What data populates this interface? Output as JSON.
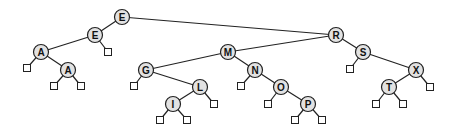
{
  "diagram": {
    "type": "binary-search-tree",
    "nodes": [
      {
        "id": "n1",
        "label": "E",
        "x": 122,
        "y": 17
      },
      {
        "id": "n2",
        "label": "E",
        "x": 95,
        "y": 35
      },
      {
        "id": "n3",
        "label": "A",
        "x": 41,
        "y": 52
      },
      {
        "id": "n4",
        "label": "A",
        "x": 68,
        "y": 70
      },
      {
        "id": "n5",
        "label": "R",
        "x": 336,
        "y": 35
      },
      {
        "id": "n6",
        "label": "M",
        "x": 228,
        "y": 52
      },
      {
        "id": "n7",
        "label": "G",
        "x": 146,
        "y": 70
      },
      {
        "id": "n8",
        "label": "L",
        "x": 200,
        "y": 87
      },
      {
        "id": "n9",
        "label": "I",
        "x": 173,
        "y": 104
      },
      {
        "id": "n10",
        "label": "N",
        "x": 255,
        "y": 70
      },
      {
        "id": "n11",
        "label": "O",
        "x": 281,
        "y": 87
      },
      {
        "id": "n12",
        "label": "P",
        "x": 308,
        "y": 104
      },
      {
        "id": "n13",
        "label": "S",
        "x": 363,
        "y": 52
      },
      {
        "id": "n14",
        "label": "X",
        "x": 416,
        "y": 70
      },
      {
        "id": "n15",
        "label": "T",
        "x": 389,
        "y": 87
      }
    ],
    "leaves": [
      {
        "x": 108,
        "y": 52,
        "parent": "n2"
      },
      {
        "x": 27,
        "y": 68,
        "parent": "n3"
      },
      {
        "x": 54,
        "y": 86,
        "parent": "n4"
      },
      {
        "x": 81,
        "y": 86,
        "parent": "n4"
      },
      {
        "x": 134,
        "y": 86,
        "parent": "n7"
      },
      {
        "x": 214,
        "y": 104,
        "parent": "n8"
      },
      {
        "x": 160,
        "y": 120,
        "parent": "n9"
      },
      {
        "x": 187,
        "y": 120,
        "parent": "n9"
      },
      {
        "x": 241,
        "y": 86,
        "parent": "n10"
      },
      {
        "x": 268,
        "y": 104,
        "parent": "n11"
      },
      {
        "x": 295,
        "y": 120,
        "parent": "n12"
      },
      {
        "x": 322,
        "y": 120,
        "parent": "n12"
      },
      {
        "x": 350,
        "y": 69,
        "parent": "n13"
      },
      {
        "x": 430,
        "y": 87,
        "parent": "n14"
      },
      {
        "x": 376,
        "y": 104,
        "parent": "n15"
      },
      {
        "x": 403,
        "y": 104,
        "parent": "n15"
      }
    ],
    "edges": [
      [
        "n1",
        "n2"
      ],
      [
        "n1",
        "n5"
      ],
      [
        "n2",
        "n3"
      ],
      [
        "n3",
        "n4"
      ],
      [
        "n5",
        "n6"
      ],
      [
        "n5",
        "n13"
      ],
      [
        "n6",
        "n7"
      ],
      [
        "n6",
        "n10"
      ],
      [
        "n7",
        "n8"
      ],
      [
        "n8",
        "n9"
      ],
      [
        "n10",
        "n11"
      ],
      [
        "n11",
        "n12"
      ],
      [
        "n13",
        "n14"
      ],
      [
        "n14",
        "n15"
      ]
    ],
    "colors": {
      "node_fill": "#e2e2e2",
      "stroke": "#222222",
      "leaf_fill": "#ffffff"
    }
  }
}
